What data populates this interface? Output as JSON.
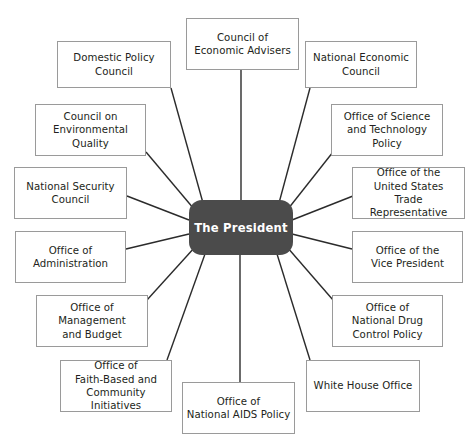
{
  "diagram": {
    "type": "hub-and-spoke organizational chart",
    "canvas": {
      "width": 474,
      "height": 448,
      "background": "#ffffff"
    },
    "colors": {
      "hub_fill": "#4b4b4b",
      "hub_text": "#ffffff",
      "node_fill": "#ffffff",
      "node_border": "#9a9a9a",
      "node_text": "#231f20",
      "connector": "#2b2b2b"
    },
    "hub": {
      "label": "The President",
      "x": 189,
      "y": 200,
      "width": 104,
      "height": 55
    },
    "nodes": [
      {
        "id": "council-of-economic-advisers",
        "label": "Council of\nEconomic Advisers",
        "x": 186,
        "y": 18,
        "width": 113,
        "height": 52,
        "anchor_x": 241,
        "anchor_y": 70,
        "hub_x": 241,
        "hub_y": 200
      },
      {
        "id": "national-economic-council",
        "label": "National Economic\nCouncil",
        "x": 305,
        "y": 41,
        "width": 112,
        "height": 47,
        "anchor_x": 310,
        "anchor_y": 88,
        "hub_x": 279,
        "hub_y": 203
      },
      {
        "id": "office-of-science-and-technology-policy",
        "label": "Office of Science\nand Technology\nPolicy",
        "x": 331,
        "y": 104,
        "width": 112,
        "height": 52,
        "anchor_x": 333,
        "anchor_y": 152,
        "hub_x": 288,
        "hub_y": 209
      },
      {
        "id": "office-of-the-united-states-trade-representative",
        "label": "Office of the\nUnited States\nTrade Representative",
        "x": 352,
        "y": 167,
        "width": 113,
        "height": 52,
        "anchor_x": 353,
        "anchor_y": 196,
        "hub_x": 292,
        "hub_y": 220
      },
      {
        "id": "office-of-the-vice-president",
        "label": "Office of the\nVice President",
        "x": 352,
        "y": 231,
        "width": 111,
        "height": 52,
        "anchor_x": 352,
        "anchor_y": 249,
        "hub_x": 292,
        "hub_y": 234
      },
      {
        "id": "office-of-national-drug-control-policy",
        "label": "Office of\nNational Drug\nControl Policy",
        "x": 332,
        "y": 295,
        "width": 111,
        "height": 52,
        "anchor_x": 333,
        "anchor_y": 300,
        "hub_x": 287,
        "hub_y": 247
      },
      {
        "id": "white-house-office",
        "label": "White House Office",
        "x": 306,
        "y": 360,
        "width": 114,
        "height": 52,
        "anchor_x": 310,
        "anchor_y": 360,
        "hub_x": 277,
        "hub_y": 254
      },
      {
        "id": "office-of-national-aids-policy",
        "label": "Office of\nNational AIDS Policy",
        "x": 182,
        "y": 382,
        "width": 113,
        "height": 52,
        "anchor_x": 240,
        "anchor_y": 382,
        "hub_x": 240,
        "hub_y": 255
      },
      {
        "id": "office-of-faith-based-and-community-initiatives",
        "label": "Office of\nFaith-Based and\nCommunity Initiatives",
        "x": 60,
        "y": 360,
        "width": 112,
        "height": 52,
        "anchor_x": 167,
        "anchor_y": 360,
        "hub_x": 205,
        "hub_y": 254
      },
      {
        "id": "office-of-management-and-budget",
        "label": "Office of\nManagement\nand Budget",
        "x": 36,
        "y": 295,
        "width": 112,
        "height": 52,
        "anchor_x": 147,
        "anchor_y": 300,
        "hub_x": 195,
        "hub_y": 247
      },
      {
        "id": "office-of-administration",
        "label": "Office of\nAdministration",
        "x": 15,
        "y": 231,
        "width": 111,
        "height": 52,
        "anchor_x": 126,
        "anchor_y": 249,
        "hub_x": 189,
        "hub_y": 234
      },
      {
        "id": "national-security-council",
        "label": "National Security\nCouncil",
        "x": 14,
        "y": 167,
        "width": 113,
        "height": 52,
        "anchor_x": 127,
        "anchor_y": 196,
        "hub_x": 189,
        "hub_y": 220
      },
      {
        "id": "council-on-environmental-quality",
        "label": "Council on\nEnvironmental\nQuality",
        "x": 35,
        "y": 104,
        "width": 111,
        "height": 52,
        "anchor_x": 146,
        "anchor_y": 152,
        "hub_x": 194,
        "hub_y": 209
      },
      {
        "id": "domestic-policy-council",
        "label": "Domestic Policy\nCouncil",
        "x": 57,
        "y": 41,
        "width": 114,
        "height": 47,
        "anchor_x": 171,
        "anchor_y": 88,
        "hub_x": 203,
        "hub_y": 203
      }
    ]
  }
}
